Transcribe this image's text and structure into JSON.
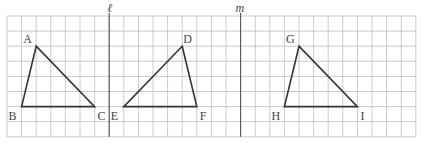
{
  "figure": {
    "grid": {
      "columns": 28,
      "rows": 8,
      "origin_x": 7,
      "origin_y": 16,
      "cell_w": 14.6,
      "cell_h": 15.1,
      "color": "#bdbdbd"
    },
    "axes": [
      {
        "name": "l",
        "label": "ℓ",
        "col": 7
      },
      {
        "name": "m",
        "label": "m",
        "col": 16
      }
    ],
    "triangles": [
      {
        "name": "ABC",
        "vertices": [
          {
            "label": "A",
            "col": 2,
            "row": 2
          },
          {
            "label": "B",
            "col": 1,
            "row": 6
          },
          {
            "label": "C",
            "col": 6,
            "row": 6
          }
        ]
      },
      {
        "name": "DEF",
        "vertices": [
          {
            "label": "D",
            "col": 12,
            "row": 2
          },
          {
            "label": "E",
            "col": 8,
            "row": 6
          },
          {
            "label": "F",
            "col": 13,
            "row": 6
          }
        ]
      },
      {
        "name": "GHI",
        "vertices": [
          {
            "label": "G",
            "col": 20,
            "row": 2
          },
          {
            "label": "H",
            "col": 19,
            "row": 6
          },
          {
            "label": "I",
            "col": 24,
            "row": 6
          }
        ]
      }
    ]
  }
}
